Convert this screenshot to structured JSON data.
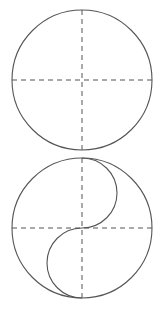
{
  "diagram": {
    "stroke_color": "#555555",
    "dash_color": "#555555",
    "figures": [
      {
        "name": "circle-quartered",
        "center": [
          82,
          80
        ],
        "radius": 70,
        "dashed_lines": [
          "vertical-diameter",
          "horizontal-diameter"
        ],
        "curve": null
      },
      {
        "name": "circle-with-s-curve",
        "center": [
          82,
          228
        ],
        "radius": 70,
        "dashed_lines": [
          "vertical-diameter",
          "horizontal-diameter"
        ],
        "curve": "s-curve"
      }
    ]
  }
}
